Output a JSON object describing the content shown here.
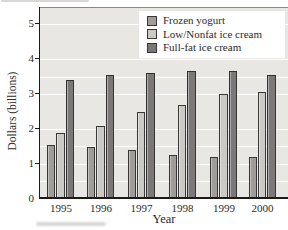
{
  "chart_data": {
    "type": "bar",
    "title": "",
    "xlabel": "Year",
    "ylabel": "Dollars (billions)",
    "ylim": [
      0,
      5
    ],
    "ytick_interval": 1,
    "ytick_labels": [
      "0",
      "1",
      "2",
      "3",
      "4",
      "5"
    ],
    "gridline_interval": 0.5,
    "grid": true,
    "legend_position": "top-right",
    "categories": [
      "1995",
      "1996",
      "1997",
      "1998",
      "1999",
      "2000"
    ],
    "series": [
      {
        "name": "Frozen yogurt",
        "color": "#a09c9a",
        "values": [
          1.55,
          1.5,
          1.4,
          1.25,
          1.2,
          1.2
        ]
      },
      {
        "name": "Low/Nonfat ice cream",
        "color": "#cbc9c6",
        "values": [
          1.9,
          2.1,
          2.5,
          2.7,
          3.0,
          3.05
        ]
      },
      {
        "name": "Full-fat ice cream",
        "color": "#7b7877",
        "values": [
          3.4,
          3.55,
          3.6,
          3.65,
          3.65,
          3.55
        ]
      }
    ],
    "colors": {
      "plot_background": "#e9e7e4",
      "gridline": "#ffffff",
      "axis": "#1d1b1a",
      "bar_border": "#2a2826",
      "text": "#2e2a28",
      "legend_background": "#ffffff"
    }
  }
}
